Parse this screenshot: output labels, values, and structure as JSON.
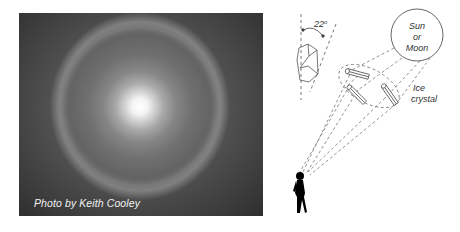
{
  "photo": {
    "description": "22-degree halo around bright sun/moon",
    "credit": "Photo by Keith Cooley"
  },
  "diagram": {
    "angle_label": "22°",
    "angle_value": "22",
    "angle_unit": "o",
    "light_source_label": [
      "Sun",
      "or",
      "Moon"
    ],
    "crystal_label": [
      "Ice",
      "crystal"
    ],
    "elements": [
      "hexagonal-ice-crystal",
      "angle-arc",
      "sun-or-moon-circle",
      "ice-crystal-columns",
      "observer-silhouette",
      "light-ray-dashed-lines"
    ]
  },
  "colors": {
    "line": "#555555",
    "text": "#333333",
    "silhouette": "#000000"
  }
}
